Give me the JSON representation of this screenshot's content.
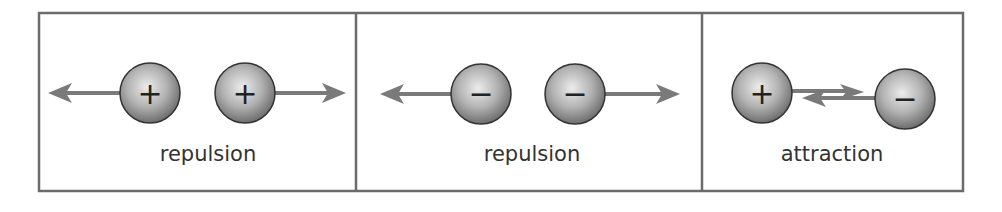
{
  "diagram": {
    "colors": {
      "border": "#6b6b6b",
      "arrow": "#7a7a7a",
      "sphere_light": "#e6e6e6",
      "sphere_dark": "#7d7d7d",
      "text": "#333333"
    },
    "panels": [
      {
        "label": "repulsion",
        "charges": [
          "+",
          "+"
        ],
        "interaction": "repulsion",
        "arrows": "outward"
      },
      {
        "label": "repulsion",
        "charges": [
          "−",
          "−"
        ],
        "interaction": "repulsion",
        "arrows": "outward"
      },
      {
        "label": "attraction",
        "charges": [
          "+",
          "−"
        ],
        "interaction": "attraction",
        "arrows": "inward"
      }
    ]
  }
}
